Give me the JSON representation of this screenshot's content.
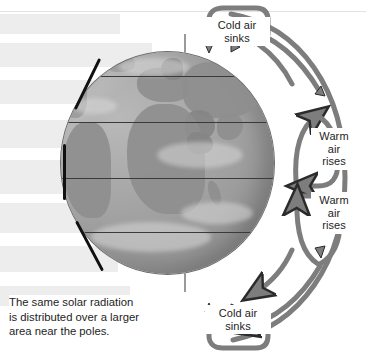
{
  "figure": {
    "width": 366,
    "height": 356,
    "background": "#ffffff"
  },
  "colors": {
    "arrow": "#7d7d7d",
    "arrow_outline": "#2b2b2b",
    "globe_light": "#b9b9b9",
    "globe_dark": "#8c8c8c",
    "land": "#8e8e8e",
    "latitude_line": "#3a3a3a",
    "beam": "#ededed",
    "text": "#1d1d1d",
    "limb_mark": "#111111",
    "page_rule": "#e2e2e2"
  },
  "labels": {
    "cold_air_sinks_top": "Cold air\nsinks",
    "warm_air_rises_upper": "Warm\nair\nrises",
    "warm_air_rises_lower": "Warm\nair\nrises",
    "cold_air_sinks_bottom": "Cold air\nsinks"
  },
  "caption": {
    "text": "The same solar radiation\nis distributed over a larger\narea near the poles."
  },
  "globe": {
    "center_x": 167,
    "center_y": 163,
    "radius_x": 106,
    "radius_y": 111,
    "latitude_lines_y": [
      76,
      122,
      178,
      232,
      281
    ],
    "pole_tick_top_y": 36,
    "pole_tick_bottom_y": 276,
    "visible_landmasses": [
      "Europe",
      "Africa",
      "South America",
      "Asia",
      "Arabia",
      "Madagascar",
      "Greenland"
    ]
  },
  "solar_beams": {
    "fill": "#ededed",
    "bands": [
      {
        "top": 14,
        "height": 20,
        "width": 120
      },
      {
        "top": 43,
        "height": 24,
        "width": 150
      },
      {
        "top": 80,
        "height": 24,
        "width": 120
      },
      {
        "top": 120,
        "height": 28,
        "width": 110
      },
      {
        "top": 160,
        "height": 34,
        "width": 86
      },
      {
        "top": 202,
        "height": 30,
        "width": 96
      },
      {
        "top": 245,
        "height": 26,
        "width": 118
      },
      {
        "top": 285,
        "height": 22,
        "width": 132
      }
    ]
  },
  "convection_cells": [
    {
      "name": "northern-polar-cell",
      "direction": "cold-air-sinks",
      "position": "top"
    },
    {
      "name": "northern-hadley-cell",
      "direction": "warm-air-rises",
      "position": "upper-right"
    },
    {
      "name": "southern-hadley-cell",
      "direction": "warm-air-rises",
      "position": "lower-right"
    },
    {
      "name": "southern-polar-cell",
      "direction": "cold-air-sinks",
      "position": "bottom"
    }
  ]
}
